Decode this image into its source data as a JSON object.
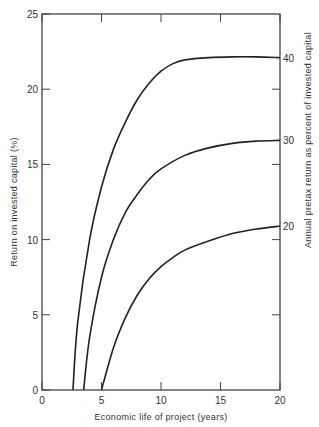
{
  "chart_data": {
    "type": "line",
    "title": "",
    "xlabel": "Economic life of project (years)",
    "ylabel": "Return on invested capital (%)",
    "ylabel_right": "Annual pretax return as percent of invested capital",
    "xlim": [
      0,
      20
    ],
    "ylim": [
      0,
      25
    ],
    "grid": false,
    "x_ticks": [
      "0",
      "5",
      "10",
      "15",
      "20"
    ],
    "y_ticks": [
      "0",
      "5",
      "10",
      "15",
      "20",
      "25"
    ],
    "right_tick_labels": [
      {
        "label": "40",
        "left_value": 22.1
      },
      {
        "label": "30",
        "left_value": 16.6
      },
      {
        "label": "20",
        "left_value": 10.9
      }
    ],
    "series": [
      {
        "name": "40",
        "x": [
          2.6,
          3,
          4,
          5,
          6,
          7,
          8,
          9,
          10,
          11,
          12,
          14,
          16,
          18,
          20
        ],
        "y": [
          0,
          4.5,
          10,
          13.5,
          16,
          17.8,
          19.3,
          20.4,
          21.2,
          21.7,
          21.95,
          22.1,
          22.15,
          22.15,
          22.1
        ]
      },
      {
        "name": "30",
        "x": [
          3.5,
          4,
          5,
          6,
          7,
          8,
          9,
          10,
          12,
          14,
          16,
          18,
          20
        ],
        "y": [
          0,
          3.5,
          7.5,
          10,
          11.8,
          13,
          14,
          14.7,
          15.6,
          16.1,
          16.4,
          16.55,
          16.6
        ]
      },
      {
        "name": "20",
        "x": [
          5,
          6,
          7,
          8,
          9,
          10,
          11,
          12,
          14,
          16,
          18,
          20
        ],
        "y": [
          0,
          2.8,
          4.8,
          6.3,
          7.4,
          8.2,
          8.8,
          9.3,
          9.9,
          10.4,
          10.7,
          10.9
        ]
      }
    ]
  }
}
